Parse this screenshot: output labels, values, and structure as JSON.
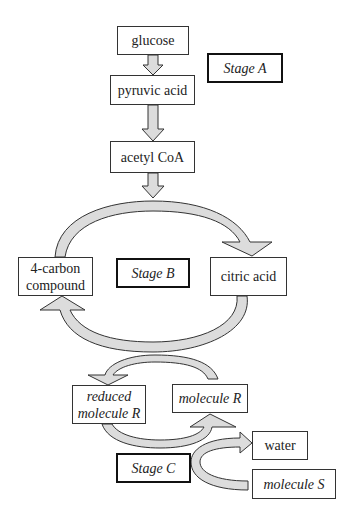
{
  "diagram": {
    "type": "cellular respiration flow diagram",
    "colors": {
      "arrow_fill": "#dcdcdc",
      "outline": "#333333",
      "background": "#ffffff"
    },
    "stages": {
      "a": "Stage A",
      "b": "Stage B",
      "c": "Stage C"
    },
    "molecules": {
      "glucose": "glucose",
      "pyruvic_acid": "pyruvic acid",
      "acetyl_coa": "acetyl CoA",
      "four_carbon_line1": "4-carbon",
      "four_carbon_line2": "compound",
      "citric_acid": "citric acid",
      "reduced_r_line1": "reduced",
      "reduced_r_line2": "molecule R",
      "molecule_r": "molecule R",
      "water": "water",
      "molecule_s": "molecule S"
    },
    "flows": [
      {
        "from": "glucose",
        "to": "pyruvic acid",
        "stage": "Stage A"
      },
      {
        "from": "pyruvic acid",
        "to": "acetyl CoA",
        "stage": "Stage A"
      },
      {
        "from": "acetyl CoA",
        "to": "citric acid",
        "stage": "Stage B"
      },
      {
        "from": "citric acid",
        "to": "4-carbon compound",
        "stage": "Stage B"
      },
      {
        "from": "molecule R",
        "to": "reduced molecule R",
        "stage": "Stage C"
      },
      {
        "from": "reduced molecule R",
        "to": "molecule R",
        "stage": "Stage C"
      },
      {
        "from": "molecule S",
        "to": "water",
        "stage": "Stage C"
      }
    ]
  }
}
